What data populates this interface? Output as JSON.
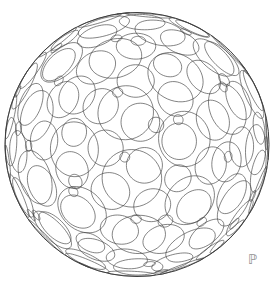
{
  "canvas": {
    "width": 278,
    "height": 288,
    "background": "#ffffff"
  },
  "figure": {
    "type": "sphere-circle-packing-wireframe",
    "sphere": {
      "cx": 137,
      "cy": 144.5,
      "radius_px": 132,
      "outline_color": "#3d3d3d",
      "outline_width": 1.0
    },
    "projection": {
      "type": "perspective",
      "camera_distance_sphere_radii": 4.5
    },
    "rotation_deg": {
      "x": 12,
      "y": -24,
      "z": 6
    },
    "circle_style": {
      "stroke": "#454545",
      "stroke_width": 0.7,
      "fill": "none",
      "opacity": 0.95
    },
    "cap_classes": [
      {
        "name": "hexagon-site-circles",
        "sites": "icosahedron-face-centers",
        "count": 20,
        "angular_radius_deg": 10.5
      },
      {
        "name": "vertex-site-circles",
        "sites": "truncated-icosahedron-vertices",
        "count": 60,
        "angular_radius_deg": 9.8
      },
      {
        "name": "pentagon-site-circles",
        "sites": "icosahedron-vertices",
        "count": 12,
        "angular_radius_deg": 7.4
      },
      {
        "name": "edge-site-circles",
        "sites": "icosahedron-edge-midpoints",
        "count": 30,
        "angular_radius_deg": 2.7
      }
    ],
    "samples_per_circle": 48
  },
  "watermark": {
    "glyph": "ℙ",
    "color": "#8f8f8f",
    "font_size_px": 13,
    "left_px": 248,
    "top_px": 253
  }
}
